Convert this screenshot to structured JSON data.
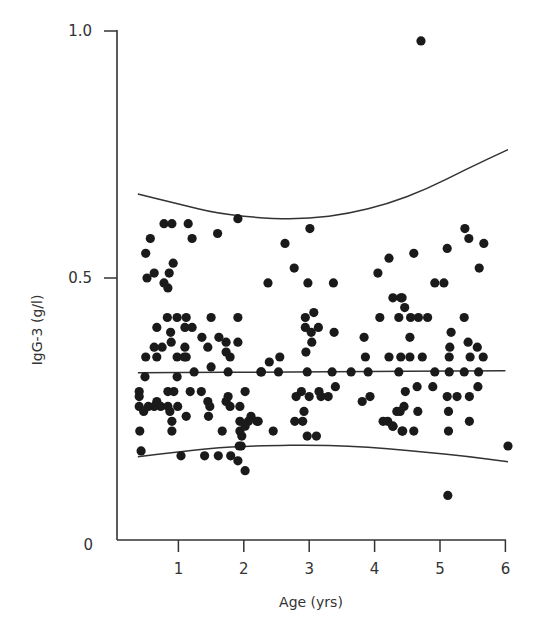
{
  "chart_data": {
    "type": "scatter",
    "title": "",
    "xlabel": "Age (yrs)",
    "ylabel": "IgG-3 (g/l)",
    "xlim": [
      0.1,
      6.0
    ],
    "ylim": [
      0,
      1.0
    ],
    "x_ticks": [
      1,
      2,
      3,
      4,
      5,
      6
    ],
    "x_tick_labels": [
      "1",
      "2",
      "3",
      "4",
      "5",
      "6"
    ],
    "y_ticks": [
      0,
      0.5,
      1.0
    ],
    "y_tick_labels": [
      "0",
      "0.5",
      "1.0"
    ],
    "grid": false,
    "legend": null,
    "series": [
      {
        "name": "observations",
        "marker": "filled-circle",
        "color": "#1a1a1a",
        "points": [
          [
            0.78,
            0.61
          ],
          [
            0.9,
            0.61
          ],
          [
            1.15,
            0.61
          ],
          [
            1.91,
            0.62
          ],
          [
            0.57,
            0.58
          ],
          [
            1.21,
            0.58
          ],
          [
            1.6,
            0.59
          ],
          [
            0.5,
            0.55
          ],
          [
            0.92,
            0.53
          ],
          [
            0.63,
            0.51
          ],
          [
            0.52,
            0.5
          ],
          [
            0.86,
            0.51
          ],
          [
            0.78,
            0.49
          ],
          [
            0.84,
            0.48
          ],
          [
            0.83,
            0.42
          ],
          [
            0.98,
            0.42
          ],
          [
            1.12,
            0.42
          ],
          [
            1.5,
            0.42
          ],
          [
            1.91,
            0.42
          ],
          [
            0.67,
            0.4
          ],
          [
            0.88,
            0.39
          ],
          [
            1.1,
            0.4
          ],
          [
            1.21,
            0.4
          ],
          [
            0.89,
            0.37
          ],
          [
            1.36,
            0.38
          ],
          [
            1.62,
            0.38
          ],
          [
            0.63,
            0.36
          ],
          [
            0.75,
            0.36
          ],
          [
            1.1,
            0.36
          ],
          [
            1.45,
            0.36
          ],
          [
            1.73,
            0.37
          ],
          [
            1.73,
            0.35
          ],
          [
            1.91,
            0.37
          ],
          [
            1.79,
            0.34
          ],
          [
            0.5,
            0.34
          ],
          [
            0.67,
            0.34
          ],
          [
            0.98,
            0.34
          ],
          [
            1.09,
            0.34
          ],
          [
            1.12,
            0.34
          ],
          [
            1.5,
            0.32
          ],
          [
            1.76,
            0.31
          ],
          [
            0.49,
            0.3
          ],
          [
            0.98,
            0.3
          ],
          [
            1.24,
            0.31
          ],
          [
            2.26,
            0.31
          ],
          [
            0.4,
            0.27
          ],
          [
            0.4,
            0.26
          ],
          [
            0.84,
            0.27
          ],
          [
            0.93,
            0.27
          ],
          [
            1.18,
            0.27
          ],
          [
            1.35,
            0.27
          ],
          [
            2.02,
            0.27
          ],
          [
            0.67,
            0.25
          ],
          [
            1.45,
            0.25
          ],
          [
            1.73,
            0.25
          ],
          [
            1.76,
            0.26
          ],
          [
            1.79,
            0.24
          ],
          [
            0.4,
            0.24
          ],
          [
            0.54,
            0.24
          ],
          [
            0.63,
            0.24
          ],
          [
            0.73,
            0.24
          ],
          [
            0.84,
            0.24
          ],
          [
            0.99,
            0.24
          ],
          [
            1.48,
            0.24
          ],
          [
            1.94,
            0.24
          ],
          [
            0.47,
            0.23
          ],
          [
            0.87,
            0.23
          ],
          [
            1.12,
            0.22
          ],
          [
            1.46,
            0.22
          ],
          [
            2.11,
            0.22
          ],
          [
            2.07,
            0.21
          ],
          [
            1.94,
            0.21
          ],
          [
            2.02,
            0.2
          ],
          [
            2.2,
            0.21
          ],
          [
            0.9,
            0.21
          ],
          [
            0.41,
            0.19
          ],
          [
            0.9,
            0.19
          ],
          [
            1.67,
            0.19
          ],
          [
            1.94,
            0.19
          ],
          [
            1.97,
            0.18
          ],
          [
            1.96,
            0.16
          ],
          [
            0.43,
            0.15
          ],
          [
            1.04,
            0.14
          ],
          [
            1.4,
            0.14
          ],
          [
            1.61,
            0.14
          ],
          [
            1.8,
            0.14
          ],
          [
            1.93,
            0.16
          ],
          [
            1.91,
            0.13
          ],
          [
            2.02,
            0.11
          ],
          [
            3.01,
            0.6
          ],
          [
            2.63,
            0.57
          ],
          [
            2.77,
            0.52
          ],
          [
            2.37,
            0.49
          ],
          [
            2.98,
            0.49
          ],
          [
            3.37,
            0.49
          ],
          [
            4.22,
            0.54
          ],
          [
            4.05,
            0.51
          ],
          [
            4.28,
            0.46
          ],
          [
            4.4,
            0.46
          ],
          [
            4.46,
            0.44
          ],
          [
            3.07,
            0.43
          ],
          [
            2.94,
            0.42
          ],
          [
            4.08,
            0.42
          ],
          [
            4.37,
            0.42
          ],
          [
            2.94,
            0.4
          ],
          [
            3.14,
            0.4
          ],
          [
            3.03,
            0.39
          ],
          [
            3.38,
            0.39
          ],
          [
            3.04,
            0.37
          ],
          [
            3.84,
            0.38
          ],
          [
            2.95,
            0.35
          ],
          [
            2.39,
            0.33
          ],
          [
            2.55,
            0.34
          ],
          [
            3.86,
            0.34
          ],
          [
            4.22,
            0.34
          ],
          [
            4.4,
            0.34
          ],
          [
            2.27,
            0.31
          ],
          [
            2.53,
            0.31
          ],
          [
            2.97,
            0.31
          ],
          [
            3.35,
            0.31
          ],
          [
            3.64,
            0.31
          ],
          [
            3.9,
            0.31
          ],
          [
            4.37,
            0.31
          ],
          [
            3.4,
            0.28
          ],
          [
            2.88,
            0.27
          ],
          [
            3.15,
            0.27
          ],
          [
            2.8,
            0.26
          ],
          [
            3.0,
            0.26
          ],
          [
            3.18,
            0.26
          ],
          [
            3.29,
            0.26
          ],
          [
            3.93,
            0.26
          ],
          [
            2.92,
            0.23
          ],
          [
            3.81,
            0.25
          ],
          [
            4.34,
            0.23
          ],
          [
            2.22,
            0.21
          ],
          [
            2.78,
            0.21
          ],
          [
            2.9,
            0.21
          ],
          [
            4.2,
            0.21
          ],
          [
            4.28,
            0.2
          ],
          [
            2.45,
            0.19
          ],
          [
            2.97,
            0.18
          ],
          [
            3.11,
            0.18
          ],
          [
            4.42,
            0.19
          ],
          [
            4.71,
            0.98
          ],
          [
            5.38,
            0.6
          ],
          [
            5.44,
            0.58
          ],
          [
            5.67,
            0.57
          ],
          [
            5.11,
            0.56
          ],
          [
            4.6,
            0.55
          ],
          [
            5.6,
            0.52
          ],
          [
            5.06,
            0.49
          ],
          [
            4.92,
            0.49
          ],
          [
            4.42,
            0.46
          ],
          [
            4.55,
            0.42
          ],
          [
            4.67,
            0.42
          ],
          [
            4.81,
            0.42
          ],
          [
            5.37,
            0.42
          ],
          [
            5.17,
            0.39
          ],
          [
            4.54,
            0.38
          ],
          [
            5.15,
            0.36
          ],
          [
            5.43,
            0.37
          ],
          [
            5.57,
            0.36
          ],
          [
            5.14,
            0.34
          ],
          [
            5.46,
            0.34
          ],
          [
            5.66,
            0.34
          ],
          [
            4.54,
            0.34
          ],
          [
            4.73,
            0.34
          ],
          [
            4.92,
            0.31
          ],
          [
            5.14,
            0.31
          ],
          [
            5.37,
            0.31
          ],
          [
            5.59,
            0.31
          ],
          [
            4.47,
            0.27
          ],
          [
            4.65,
            0.28
          ],
          [
            4.89,
            0.28
          ],
          [
            5.58,
            0.28
          ],
          [
            5.11,
            0.26
          ],
          [
            5.26,
            0.26
          ],
          [
            5.45,
            0.26
          ],
          [
            4.45,
            0.24
          ],
          [
            4.39,
            0.23
          ],
          [
            4.66,
            0.23
          ],
          [
            5.13,
            0.23
          ],
          [
            4.13,
            0.21
          ],
          [
            4.28,
            0.2
          ],
          [
            4.43,
            0.19
          ],
          [
            4.6,
            0.19
          ],
          [
            5.45,
            0.21
          ],
          [
            5.13,
            0.19
          ],
          [
            6.04,
            0.16
          ],
          [
            5.12,
            0.06
          ]
        ]
      }
    ],
    "lines": [
      {
        "name": "upper-reference-curve",
        "color": "#333333",
        "points": [
          [
            0.38,
            0.67
          ],
          [
            1.0,
            0.65
          ],
          [
            1.6,
            0.63
          ],
          [
            2.4,
            0.62
          ],
          [
            3.0,
            0.62
          ],
          [
            3.6,
            0.63
          ],
          [
            4.2,
            0.65
          ],
          [
            4.8,
            0.68
          ],
          [
            5.4,
            0.72
          ],
          [
            6.04,
            0.76
          ]
        ]
      },
      {
        "name": "mean-line",
        "color": "#333333",
        "points": [
          [
            0.38,
            0.308
          ],
          [
            3.0,
            0.31
          ],
          [
            6.0,
            0.312
          ]
        ]
      },
      {
        "name": "lower-reference-curve",
        "color": "#333333",
        "points": [
          [
            0.38,
            0.138
          ],
          [
            1.0,
            0.148
          ],
          [
            1.6,
            0.157
          ],
          [
            2.4,
            0.161
          ],
          [
            3.0,
            0.162
          ],
          [
            3.6,
            0.16
          ],
          [
            4.2,
            0.155
          ],
          [
            4.8,
            0.147
          ],
          [
            5.4,
            0.139
          ],
          [
            6.04,
            0.128
          ]
        ]
      }
    ]
  },
  "axes": {
    "x_title": "Age (yrs)",
    "y_title": "IgG-3 (g/l)"
  }
}
